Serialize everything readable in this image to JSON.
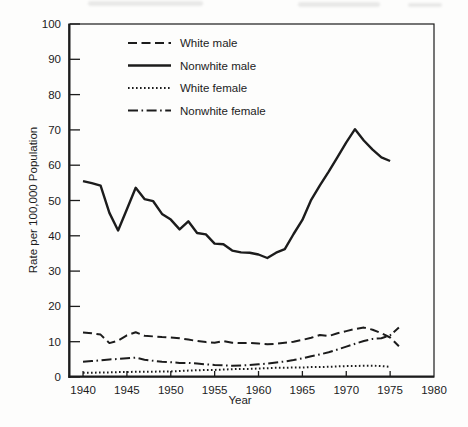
{
  "figure": {
    "background": "#fdfdfc",
    "ink": "#1c1c1c"
  },
  "chart_data": {
    "type": "line",
    "title": "",
    "xlabel": "Year",
    "ylabel": "Rate per 100,000 Population",
    "xlim": [
      1938.4,
      1980
    ],
    "ylim": [
      0,
      100
    ],
    "xticks": [
      1940,
      1945,
      1950,
      1955,
      1960,
      1965,
      1970,
      1975,
      1980
    ],
    "yticks": [
      0,
      10,
      20,
      30,
      40,
      50,
      60,
      70,
      80,
      90,
      100
    ],
    "grid": false,
    "legend_position": "top-left-inside",
    "series": [
      {
        "name": "White male",
        "dash": "long-dash",
        "x_start": 1940,
        "x_step": 1,
        "x_end": 1976,
        "values": [
          12.6,
          12.4,
          12.0,
          9.6,
          10.3,
          11.8,
          12.7,
          11.7,
          11.5,
          11.3,
          11.2,
          11.0,
          10.6,
          10.2,
          9.9,
          9.7,
          10.2,
          9.7,
          9.6,
          9.7,
          9.5,
          9.3,
          9.4,
          9.7,
          10.0,
          10.5,
          11.1,
          11.9,
          11.6,
          12.4,
          13.0,
          13.6,
          14.0,
          13.4,
          12.4,
          11.2,
          8.7
        ]
      },
      {
        "name": "Nonwhite male",
        "dash": "solid",
        "x_start": 1940,
        "x_step": 1,
        "x_end": 1975,
        "values": [
          55.5,
          54.9,
          54.2,
          46.5,
          41.5,
          47.5,
          53.6,
          50.4,
          49.8,
          46.2,
          44.6,
          41.8,
          44.1,
          40.8,
          40.4,
          37.8,
          37.6,
          35.8,
          35.3,
          35.2,
          34.7,
          33.7,
          35.2,
          36.2,
          40.5,
          44.5,
          50.2,
          54.3,
          58.2,
          62.3,
          66.5,
          70.2,
          67.0,
          64.4,
          62.2,
          61.2
        ]
      },
      {
        "name": "White female",
        "dash": "dotted",
        "x_start": 1940,
        "x_step": 1,
        "x_end": 1975,
        "values": [
          1.2,
          1.2,
          1.3,
          1.3,
          1.4,
          1.4,
          1.5,
          1.5,
          1.5,
          1.6,
          1.6,
          1.7,
          1.8,
          1.9,
          2.0,
          2.0,
          2.1,
          2.2,
          2.3,
          2.3,
          2.4,
          2.5,
          2.6,
          2.6,
          2.7,
          2.7,
          2.8,
          2.8,
          2.9,
          3.0,
          3.1,
          3.1,
          3.2,
          3.2,
          3.1,
          2.9
        ]
      },
      {
        "name": "Nonwhite female",
        "dash": "dash-dot",
        "x_start": 1940,
        "x_step": 1,
        "x_end": 1976,
        "values": [
          4.3,
          4.5,
          4.7,
          5.0,
          5.1,
          5.3,
          5.5,
          4.9,
          4.6,
          4.3,
          4.2,
          4.0,
          4.0,
          3.8,
          3.6,
          3.4,
          3.3,
          3.2,
          3.3,
          3.4,
          3.6,
          3.8,
          4.1,
          4.4,
          4.8,
          5.3,
          5.9,
          6.4,
          7.0,
          7.8,
          8.6,
          9.4,
          10.2,
          10.8,
          11.0,
          11.8,
          14.0
        ]
      }
    ]
  }
}
